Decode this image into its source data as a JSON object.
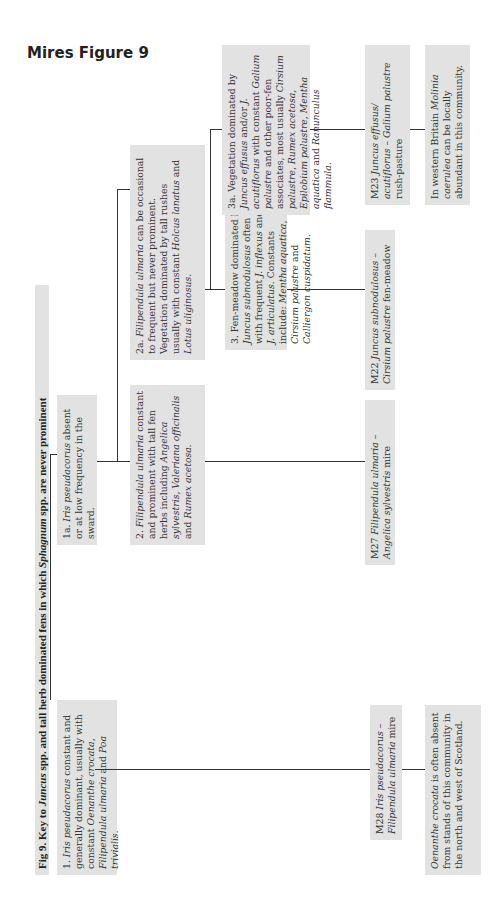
{
  "heading": "Mires Figure 9",
  "figure_title": {
    "prefix": "Fig 9. Key to ",
    "genus1": "Juncus",
    "middle": " spp. and tall herb dominated fens in which ",
    "genus2": "Sphagnum",
    "suffix": " spp. are never prominent"
  },
  "nodes": {
    "n1": [
      {
        "t": "1. "
      },
      {
        "t": "Iris pseudacorus",
        "i": true
      },
      {
        "t": " constant and generally dominant, usually with constant "
      },
      {
        "t": "Oenanthe crocata, Filipendula ulmaria",
        "i": true
      },
      {
        "t": " and "
      },
      {
        "t": "Poa trivialis.",
        "i": true
      }
    ],
    "n1a": [
      {
        "t": "1a. "
      },
      {
        "t": "Iris pseudacorus",
        "i": true
      },
      {
        "t": " absent or at low frequency in the sward."
      }
    ],
    "n2": [
      {
        "t": "2. "
      },
      {
        "t": "Filipendula ulmaria",
        "i": true
      },
      {
        "t": " constant and prominent with tall fen herbs including "
      },
      {
        "t": "Angelica sylvestris, Valeriana officinalis",
        "i": true
      },
      {
        "t": " and "
      },
      {
        "t": "Rumex acetosa.",
        "i": true
      }
    ],
    "n2a": [
      {
        "t": "2a. "
      },
      {
        "t": "Filipendula ulmaria",
        "i": true
      },
      {
        "t": " can be occasional to frequent but never prominent. Vegetation dominated by tall rushes usually with constant "
      },
      {
        "t": "Holcus lanatus",
        "i": true
      },
      {
        "t": " and "
      },
      {
        "t": "Lotus uliginosus.",
        "i": true
      }
    ],
    "n3": [
      {
        "t": "3. Fen-meadow dominated by "
      },
      {
        "t": "Juncus subnodulosus",
        "i": true
      },
      {
        "t": " often with frequent "
      },
      {
        "t": "J. inflexus",
        "i": true
      },
      {
        "t": " and/or "
      },
      {
        "t": "J. articulatus.",
        "i": true
      },
      {
        "t": " Constants include: "
      },
      {
        "t": "Mentha aquatica, Cirsium palustre",
        "i": true
      },
      {
        "t": " and "
      },
      {
        "t": "Calliergon cuspidatum.",
        "i": true
      }
    ],
    "n3a": [
      {
        "t": "3a. Vegetation dominated by "
      },
      {
        "t": "Juncus effusus",
        "i": true
      },
      {
        "t": " and/or "
      },
      {
        "t": "J. acutiflorus",
        "i": true
      },
      {
        "t": " with constant "
      },
      {
        "t": "Galium palustre",
        "i": true
      },
      {
        "t": " and other poor-fen associates, most usually "
      },
      {
        "t": "Cirsium palustre, Rumex acetosa, Epilobium palustre, Mentha aquatica",
        "i": true
      },
      {
        "t": " and "
      },
      {
        "t": "Ranunculus flammula.",
        "i": true
      }
    ],
    "m28": [
      {
        "t": "M28 "
      },
      {
        "t": "Iris pseudacorus – Filipendula ulmaria",
        "i": true
      },
      {
        "t": " mire"
      }
    ],
    "m27": [
      {
        "t": "M27 "
      },
      {
        "t": "Filipendula ulmaria – Angelica sylvestris",
        "i": true
      },
      {
        "t": " mire"
      }
    ],
    "m22": [
      {
        "t": "M22 "
      },
      {
        "t": "Juncus subnodulosus – Cirsium palustre",
        "i": true
      },
      {
        "t": " fen-meadow"
      }
    ],
    "m23": [
      {
        "t": "M23 "
      },
      {
        "t": "Juncus effusus/ acutiflorus – Galium palustre",
        "i": true
      },
      {
        "t": " rush-pasture"
      }
    ],
    "note_m28": [
      {
        "t": "Oenanthe crocata",
        "i": true
      },
      {
        "t": " is often absent from stands of this community in the north and west of Scotland."
      }
    ],
    "note_m23": [
      {
        "t": "In western Britain "
      },
      {
        "t": "Molinia caerulea",
        "i": true
      },
      {
        "t": " can be locally abundant in this community."
      }
    ]
  },
  "colors": {
    "box_fill": "#e2e2e2",
    "line": "#333333"
  }
}
